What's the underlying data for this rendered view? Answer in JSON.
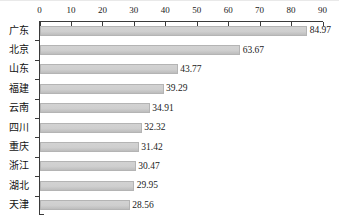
{
  "chart_data": {
    "type": "bar",
    "orientation": "horizontal",
    "title": "",
    "subtitle": "",
    "xlabel": "",
    "ylabel": "",
    "xlim": [
      0,
      90
    ],
    "xticks": [
      0,
      10,
      20,
      30,
      40,
      50,
      60,
      70,
      80,
      90
    ],
    "xtick_labels": [
      "0",
      "10",
      "20",
      "30",
      "40",
      "50",
      "60",
      "70",
      "80",
      "90"
    ],
    "grid": false,
    "legend": null,
    "axis_position": "top",
    "categories": [
      "广东",
      "北京",
      "山东",
      "福建",
      "云南",
      "四川",
      "重庆",
      "浙江",
      "湖北",
      "天津"
    ],
    "values": [
      84.97,
      63.67,
      43.77,
      39.29,
      34.91,
      32.32,
      31.42,
      30.47,
      29.95,
      28.56
    ],
    "value_labels": [
      "84.97",
      "63.67",
      "43.77",
      "39.29",
      "34.91",
      "32.32",
      "31.42",
      "30.47",
      "29.95",
      "28.56"
    ],
    "series": [
      {
        "name": "",
        "values": [
          84.97,
          63.67,
          43.77,
          39.29,
          34.91,
          32.32,
          31.42,
          30.47,
          29.95,
          28.56
        ]
      }
    ],
    "colors": {
      "bar_fill": "#cfcfcf",
      "bar_border": "#b4b4b4",
      "axis": "#3a3a3a",
      "text": "#1a1a1a",
      "background": "#ffffff"
    }
  }
}
